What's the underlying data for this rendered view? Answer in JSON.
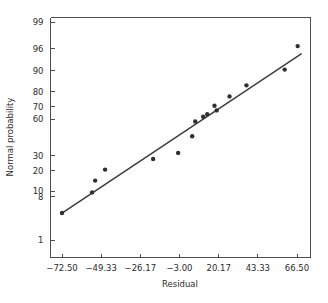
{
  "chart_data": {
    "type": "scatter",
    "title": "",
    "subtitle": "",
    "xlabel": "Residual",
    "ylabel": "Normal probability",
    "grid": false,
    "legend": null,
    "legend_position": "none",
    "x_scale": "linear",
    "y_scale": "normal-probability",
    "xlim": [
      -80.5,
      75.0
    ],
    "ylim": [
      0.6,
      99.5
    ],
    "xticks": [
      -72.5,
      -49.33,
      -26.17,
      -3.0,
      20.17,
      43.33,
      66.5
    ],
    "xtick_labels": [
      "−72.50",
      "−49.33",
      "−26.17",
      "−3.00",
      "20.17",
      "43.33",
      "66.50"
    ],
    "yticks": [
      1,
      8,
      10,
      20,
      30,
      60,
      70,
      80,
      90,
      96,
      99
    ],
    "ytick_labels": [
      "1",
      "8",
      "10",
      "20",
      "30",
      "60",
      "70",
      "80",
      "90",
      "96",
      "99"
    ],
    "series": [
      {
        "name": "Residual normal probability points",
        "type": "scatter",
        "marker": "circle",
        "color": "#2f2f2f",
        "x": [
          -72.5,
          -54.7,
          -52.9,
          -47.0,
          -18.6,
          -3.8,
          4.5,
          6.3,
          11.0,
          13.4,
          17.7,
          19.0,
          26.6,
          36.6,
          59.2,
          66.9
        ],
        "y": [
          4.0,
          9.5,
          14.5,
          20.5,
          27.5,
          32.0,
          45.5,
          58.0,
          62.0,
          64.0,
          70.5,
          67.0,
          77.0,
          83.5,
          90.5,
          96.5
        ]
      },
      {
        "name": "Reference line",
        "type": "line",
        "color": "#3d3d3d",
        "x": [
          -72.5,
          69.0
        ],
        "y": [
          4.0,
          95.0
        ]
      }
    ],
    "n_points": 16,
    "annotations": []
  },
  "axes": {
    "x_title": "Residual",
    "y_title": "Normal probability"
  }
}
